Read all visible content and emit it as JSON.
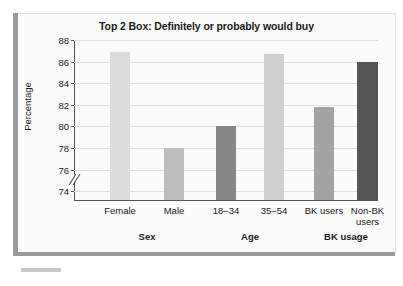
{
  "figure": {
    "title": "Top 2 Box: Definitely or probably would buy",
    "y_axis_title": "Percentage"
  },
  "chart_data": {
    "type": "bar",
    "title": "Top 2 Box: Definitely or probably would buy",
    "xlabel": "",
    "ylabel": "Percentage",
    "ylim": [
      73.2,
      88
    ],
    "y_axis_break": true,
    "grid": true,
    "legend": "none",
    "yticks": [
      74,
      76,
      78,
      80,
      82,
      84,
      86,
      88
    ],
    "ytick_labels": [
      "74",
      "76",
      "78",
      "80",
      "82",
      "84",
      "86",
      "88"
    ],
    "categories": [
      "Female",
      "Male",
      "18–34",
      "35–54",
      "BK users",
      "Non-BK users"
    ],
    "values": [
      86.9,
      78.0,
      80.0,
      86.7,
      81.8,
      86.0
    ],
    "bar_colors": [
      "#dcdcdc",
      "#bdbdbd",
      "#878787",
      "#cfcfcf",
      "#a3a3a3",
      "#555555"
    ],
    "groups": [
      {
        "label": "Sex",
        "categories": [
          "Female",
          "Male"
        ],
        "values": [
          86.9,
          78.0
        ]
      },
      {
        "label": "Age",
        "categories": [
          "18–34",
          "35–54"
        ],
        "values": [
          80.0,
          86.7
        ]
      },
      {
        "label": "BK usage",
        "categories": [
          "BK users",
          "Non-BK users"
        ],
        "values": [
          81.8,
          86.0
        ]
      }
    ]
  },
  "bars": [
    {
      "label": "Female",
      "label_line2": "",
      "value": 86.9,
      "color": "#dcdcdc",
      "x": 36,
      "width": 20
    },
    {
      "label": "Male",
      "label_line2": "",
      "value": 78.0,
      "color": "#bdbdbd",
      "x": 90,
      "width": 20
    },
    {
      "label": "18–34",
      "label_line2": "",
      "value": 80.0,
      "color": "#878787",
      "x": 142,
      "width": 20
    },
    {
      "label": "35–54",
      "label_line2": "",
      "value": 86.7,
      "color": "#cfcfcf",
      "x": 190,
      "width": 20
    },
    {
      "label": "BK users",
      "label_line2": "",
      "value": 81.8,
      "color": "#a3a3a3",
      "x": 240,
      "width": 20
    },
    {
      "label": "Non-BK",
      "label_line2": "users",
      "value": 86.0,
      "color": "#555555",
      "x": 283,
      "width": 21
    }
  ],
  "group_labels": [
    {
      "label": "Sex",
      "center": 73
    },
    {
      "label": "Age",
      "center": 176
    },
    {
      "label": "BK usage",
      "center": 272
    }
  ]
}
